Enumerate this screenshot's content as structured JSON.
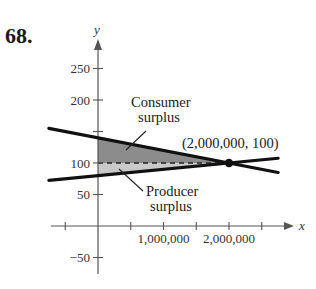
{
  "problem_number": "68.",
  "chart_data": {
    "type": "line",
    "title": "",
    "xlabel": "x",
    "ylabel": "y",
    "xlim": [
      -750000,
      2900000
    ],
    "ylim": [
      -75,
      290
    ],
    "grid": false,
    "x_ticks": [
      -500000,
      0,
      500000,
      1000000,
      1500000,
      2000000,
      2500000
    ],
    "x_tick_labels": [
      {
        "value": 1000000,
        "label": "1,000,000"
      },
      {
        "value": 2000000,
        "label": "2,000,000"
      }
    ],
    "y_ticks": [
      -50,
      50,
      100,
      150,
      200,
      250
    ],
    "y_tick_labels": [
      {
        "value": 250,
        "label": "250"
      },
      {
        "value": 200,
        "label": "200"
      },
      {
        "value": 100,
        "label": "100"
      },
      {
        "value": 50,
        "label": "50"
      },
      {
        "value": -50,
        "label": "−50"
      }
    ],
    "series": [
      {
        "name": "Demand",
        "x": [
          -750000,
          2750000
        ],
        "y": [
          155,
          85
        ],
        "color": "#111111"
      },
      {
        "name": "Supply",
        "x": [
          -750000,
          2750000
        ],
        "y": [
          72.5,
          107.5
        ],
        "color": "#111111"
      }
    ],
    "equilibrium": {
      "x": 2000000,
      "y": 100,
      "label": "(2,000,000, 100)"
    },
    "regions": [
      {
        "name": "Consumer surplus",
        "polygon": [
          [
            0,
            140
          ],
          [
            2000000,
            100
          ],
          [
            0,
            100
          ]
        ],
        "color": "#8c8c8c"
      },
      {
        "name": "Producer surplus",
        "polygon": [
          [
            0,
            100
          ],
          [
            2000000,
            100
          ],
          [
            0,
            80
          ]
        ],
        "color": "#c9c9c9"
      }
    ],
    "annotations": [
      {
        "lines": [
          "Consumer",
          "surplus"
        ],
        "points_to": "Consumer surplus"
      },
      {
        "lines": [
          "Producer",
          "surplus"
        ],
        "points_to": "Producer surplus"
      }
    ],
    "equilibrium_price_line": {
      "y": 100,
      "style": "dashed"
    }
  }
}
